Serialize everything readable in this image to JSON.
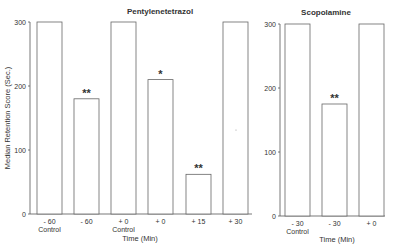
{
  "chart_data": [
    {
      "type": "bar",
      "title": "Pentylenetetrazol",
      "xlabel": "Time (Min)",
      "ylabel": "Median Retention Score (Sec.)",
      "ylim": [
        0,
        300
      ],
      "yticks": [
        "0",
        "100",
        "200",
        "300"
      ],
      "grid": false,
      "categories": [
        "- 60 Control",
        "- 60",
        "+ 0 Control",
        "+ 0",
        "+ 15",
        "+ 30"
      ],
      "category_lines": [
        [
          "- 60",
          "Control"
        ],
        [
          "- 60"
        ],
        [
          "+ 0",
          "Control"
        ],
        [
          "+ 0"
        ],
        [
          "+ 15"
        ],
        [
          "+ 30"
        ]
      ],
      "values": [
        300,
        180,
        300,
        210,
        62,
        300
      ],
      "annotations": [
        "",
        "**",
        "",
        "*",
        "**",
        ""
      ]
    },
    {
      "type": "bar",
      "title": "Scopolamine",
      "xlabel": "Time (Min)",
      "ylabel": "",
      "ylim": [
        0,
        300
      ],
      "yticks": [
        "0",
        "100",
        "200",
        "300"
      ],
      "grid": false,
      "categories": [
        "- 30 Control",
        "- 30",
        "+ 0"
      ],
      "category_lines": [
        [
          "- 30",
          "Control"
        ],
        [
          "- 30"
        ],
        [
          "+ 0"
        ]
      ],
      "values": [
        300,
        175,
        300
      ],
      "annotations": [
        "",
        "**",
        ""
      ]
    }
  ]
}
